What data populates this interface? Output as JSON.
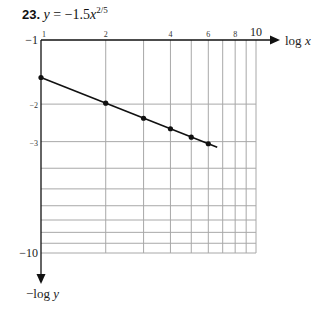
{
  "title": {
    "number": "23.",
    "equation_lhs": "y",
    "equation_rhs": "= −1.5",
    "variable": "x",
    "exponent": "2/5"
  },
  "chart_data": {
    "type": "line",
    "xlabel": "log x",
    "ylabel": "−log y",
    "xscale": "log",
    "yscale": "log",
    "xlim": [
      1,
      10
    ],
    "ylim": [
      1,
      10
    ],
    "grid": true,
    "x_tick_labels": [
      {
        "value": 1,
        "label": "1"
      },
      {
        "value": 2,
        "label": "2"
      },
      {
        "value": 4,
        "label": "4"
      },
      {
        "value": 6,
        "label": "6"
      },
      {
        "value": 8,
        "label": "8"
      },
      {
        "value": 10,
        "label": "10"
      }
    ],
    "y_tick_labels": [
      {
        "value": 1,
        "label": "−1"
      },
      {
        "value": 2,
        "label": "−2"
      },
      {
        "value": 3,
        "label": "−3"
      },
      {
        "value": 10,
        "label": "−10"
      }
    ],
    "gridlines": [
      1,
      2,
      3,
      4,
      5,
      6,
      7,
      8,
      9,
      10
    ],
    "series": [
      {
        "name": "y = −1.5x^(2/5)",
        "points": [
          {
            "x": 1,
            "y": -1.5
          },
          {
            "x": 2,
            "y": -1.98
          },
          {
            "x": 3,
            "y": -2.33
          },
          {
            "x": 4,
            "y": -2.61
          },
          {
            "x": 5,
            "y": -2.86
          },
          {
            "x": 6,
            "y": -3.07
          }
        ],
        "line_extends_to_x": 6.6
      }
    ]
  },
  "colors": {
    "line": "#111111",
    "grid": "#a8a8a8",
    "axis": "#111111"
  }
}
